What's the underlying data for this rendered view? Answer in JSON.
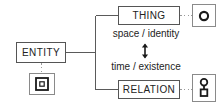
{
  "diagram": {
    "nodes": [
      {
        "id": "entity",
        "label": "ENTITY"
      },
      {
        "id": "thing",
        "label": "THING"
      },
      {
        "id": "relation",
        "label": "RELATION"
      }
    ],
    "axis_labels": {
      "upper": "space / identity",
      "lower": "time / existence"
    },
    "icons": [
      {
        "for": "entity",
        "name": "square-in-square-icon"
      },
      {
        "for": "thing",
        "name": "ring-circle-icon"
      },
      {
        "for": "relation",
        "name": "circle-over-square-icon"
      }
    ],
    "colors": {
      "background": "#ffffff",
      "node_border": "#555555",
      "icon_border": "#8a8a8a",
      "connector": "#5a5a5a",
      "dotted_connector": "#9a9a9a",
      "text": "#222222",
      "glyph": "#1a1a1a"
    }
  }
}
